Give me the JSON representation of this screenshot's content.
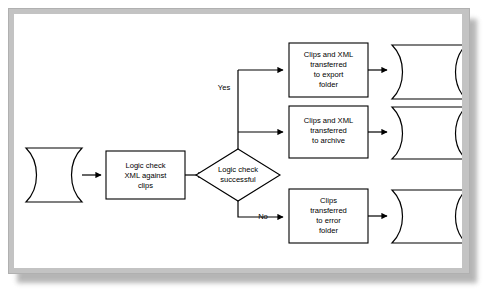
{
  "diagram": {
    "frame": {
      "border_color": "#c3c3c3",
      "inner_background": "#ffffff",
      "shadow_color": "#8f8f8f",
      "page_background": "#ffffff"
    },
    "stroke_color": "#000000",
    "nodes": [
      {
        "id": "source-tape",
        "shape": "stored-data-tape",
        "label": "",
        "x": 18,
        "y": 148,
        "width": 72,
        "height": 54
      },
      {
        "id": "logic-check-process",
        "shape": "process-rectangle",
        "label": "Logic check\nXML against\nclips",
        "lines": [
          "Logic check",
          "XML against",
          "clips"
        ],
        "x": 106,
        "y": 151,
        "width": 79,
        "height": 48
      },
      {
        "id": "logic-check-decision",
        "shape": "decision-diamond",
        "label": "Logic check\nsuccessful",
        "lines": [
          "Logic check",
          "successful"
        ],
        "x": 196,
        "y": 149,
        "width": 84,
        "height": 52
      },
      {
        "id": "export-process",
        "shape": "process-rectangle",
        "label": "Clips and XML\ntransferred\nto export\nfolder",
        "lines": [
          "Clips and XML",
          "transferred",
          "to export",
          "folder"
        ],
        "x": 289,
        "y": 43,
        "width": 79,
        "height": 54
      },
      {
        "id": "archive-process",
        "shape": "process-rectangle",
        "label": "Clips and XML\ntransferred\nto archive",
        "lines": [
          "Clips and XML",
          "transferred",
          "to archive"
        ],
        "x": 289,
        "y": 106,
        "width": 79,
        "height": 52
      },
      {
        "id": "error-process",
        "shape": "process-rectangle",
        "label": "Clips\ntransferred\nto error\nfolder",
        "lines": [
          "Clips",
          "transferred",
          "to error",
          "folder"
        ],
        "x": 289,
        "y": 189,
        "width": 79,
        "height": 54
      },
      {
        "id": "export-tape",
        "shape": "stored-data-tape",
        "label": "",
        "x": 392,
        "y": 43,
        "width": 72,
        "height": 54
      },
      {
        "id": "archive-tape",
        "shape": "stored-data-tape",
        "label": "",
        "x": 392,
        "y": 106,
        "width": 72,
        "height": 52
      },
      {
        "id": "error-tape",
        "shape": "stored-data-tape",
        "label": "",
        "x": 392,
        "y": 189,
        "width": 72,
        "height": 54
      }
    ],
    "edge_labels": {
      "yes": "Yes",
      "no": "No"
    },
    "edges": [
      {
        "id": "source-to-process",
        "from": "source-tape",
        "to": "logic-check-process",
        "label": ""
      },
      {
        "id": "process-to-decision",
        "from": "logic-check-process",
        "to": "logic-check-decision",
        "label": ""
      },
      {
        "id": "decision-to-export",
        "from": "logic-check-decision",
        "to": "export-process",
        "label": "Yes"
      },
      {
        "id": "decision-to-archive",
        "from": "logic-check-decision",
        "to": "archive-process",
        "label": ""
      },
      {
        "id": "decision-to-error",
        "from": "logic-check-decision",
        "to": "error-process",
        "label": "No"
      },
      {
        "id": "export-to-tape",
        "from": "export-process",
        "to": "export-tape",
        "label": ""
      },
      {
        "id": "archive-to-tape",
        "from": "archive-process",
        "to": "archive-tape",
        "label": ""
      },
      {
        "id": "error-to-tape",
        "from": "error-process",
        "to": "error-tape",
        "label": ""
      }
    ]
  }
}
